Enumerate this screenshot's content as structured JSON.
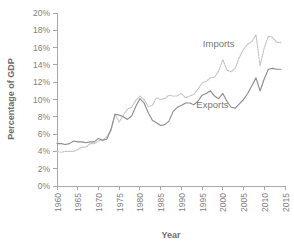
{
  "chart_data": {
    "type": "line",
    "title": "",
    "xlabel": "Year",
    "ylabel": "Percentage of GDP",
    "xlim": [
      1960,
      2015
    ],
    "ylim": [
      0,
      20
    ],
    "grid": false,
    "legend_position": "inline-annotation",
    "y_tick_labels": [
      "0%",
      "2%",
      "4%",
      "6%",
      "8%",
      "10%",
      "12%",
      "14%",
      "16%",
      "18%",
      "20%"
    ],
    "y_tick_values": [
      0,
      2,
      4,
      6,
      8,
      10,
      12,
      14,
      16,
      18,
      20
    ],
    "x_tick_labels": [
      "1960",
      "1965",
      "1970",
      "1975",
      "1980",
      "1985",
      "1990",
      "1995",
      "2000",
      "2005",
      "2010",
      "2015"
    ],
    "x_tick_values": [
      1960,
      1965,
      1970,
      1975,
      1980,
      1985,
      1990,
      1995,
      2000,
      2005,
      2010,
      2015
    ],
    "annotations": [
      {
        "text": "Imports",
        "x": 1999.0,
        "y": 16.1
      },
      {
        "text": "Exports",
        "x": 1997.5,
        "y": 9.0
      }
    ],
    "x": [
      1960,
      1961,
      1962,
      1963,
      1964,
      1965,
      1966,
      1967,
      1968,
      1969,
      1970,
      1971,
      1972,
      1973,
      1974,
      1975,
      1976,
      1977,
      1978,
      1979,
      1980,
      1981,
      1982,
      1983,
      1984,
      1985,
      1986,
      1987,
      1988,
      1989,
      1990,
      1991,
      1992,
      1993,
      1994,
      1995,
      1996,
      1997,
      1998,
      1999,
      2000,
      2001,
      2002,
      2003,
      2004,
      2005,
      2006,
      2007,
      2008,
      2009,
      2010,
      2011,
      2012,
      2013,
      2014
    ],
    "series": [
      {
        "name": "Exports",
        "color": "#8d8d8d",
        "style": "solid",
        "values": [
          4.9,
          4.9,
          4.8,
          4.9,
          5.2,
          5.1,
          5.1,
          5.0,
          5.1,
          5.1,
          5.5,
          5.3,
          5.4,
          6.5,
          8.3,
          8.2,
          8.0,
          7.7,
          8.1,
          9.2,
          10.1,
          9.6,
          8.5,
          7.6,
          7.3,
          7.0,
          7.1,
          7.5,
          8.6,
          9.1,
          9.3,
          9.6,
          9.6,
          9.4,
          9.8,
          10.5,
          10.7,
          11.0,
          10.4,
          10.1,
          10.7,
          9.8,
          9.1,
          9.0,
          9.5,
          10.0,
          10.7,
          11.6,
          12.5,
          11.0,
          12.4,
          13.5,
          13.6,
          13.5,
          13.5
        ]
      },
      {
        "name": "Imports",
        "color": "#c2c2c2",
        "style": "dotted",
        "values": [
          4.0,
          3.9,
          4.0,
          4.0,
          4.0,
          4.2,
          4.5,
          4.5,
          4.9,
          4.9,
          5.2,
          5.3,
          5.7,
          6.4,
          8.3,
          7.4,
          8.2,
          8.9,
          9.1,
          9.9,
          10.4,
          10.0,
          9.2,
          9.3,
          10.2,
          10.0,
          10.1,
          10.5,
          10.4,
          10.4,
          10.7,
          10.2,
          10.4,
          10.6,
          11.2,
          11.9,
          12.1,
          12.5,
          12.6,
          13.3,
          14.6,
          13.4,
          13.2,
          13.6,
          14.9,
          15.8,
          16.4,
          16.7,
          17.5,
          13.9,
          16.0,
          17.3,
          17.2,
          16.6,
          16.6
        ]
      }
    ]
  },
  "axis": {
    "y_title": "Percentage of GDP",
    "x_title": "Year"
  }
}
